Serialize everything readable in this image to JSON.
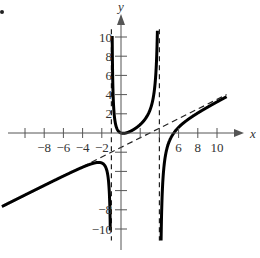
{
  "chart_data": {
    "type": "line",
    "title": "",
    "xlabel": "x",
    "ylabel": "y",
    "xlim": [
      -10.5,
      11.5
    ],
    "ylim": [
      -11,
      11
    ],
    "x_ticks": [
      -8,
      -6,
      -4,
      -2,
      6,
      8,
      10
    ],
    "x_tick_labels": [
      "−8",
      "−6",
      "−4",
      "−2",
      "6",
      "8",
      "10"
    ],
    "x_tick_marks": [
      -10,
      -8,
      -6,
      -4,
      -2,
      2,
      4,
      6,
      8,
      10
    ],
    "y_ticks": [
      10,
      8,
      6,
      4,
      2,
      -8,
      -10
    ],
    "y_tick_labels": [
      "10",
      "8",
      "6",
      "4",
      "2",
      "−8",
      "−10"
    ],
    "y_tick_marks": [
      10,
      8,
      6,
      4,
      2,
      -2,
      -4,
      -6,
      -8,
      -10
    ],
    "vertical_asymptotes": [
      -1,
      4
    ],
    "oblique_asymptote": {
      "slope": 0.5,
      "intercept": -1.5
    },
    "function": {
      "description": "rational function y = 0.5x - 1.5 + A/(x+1) + B/(x-4)",
      "A": 0.975,
      "B": -2.1,
      "zeros": [
        0,
        5.5
      ]
    },
    "series": [
      {
        "name": "f(x)",
        "style": "solid-thick"
      },
      {
        "name": "asymptotes",
        "style": "dashed"
      }
    ]
  }
}
